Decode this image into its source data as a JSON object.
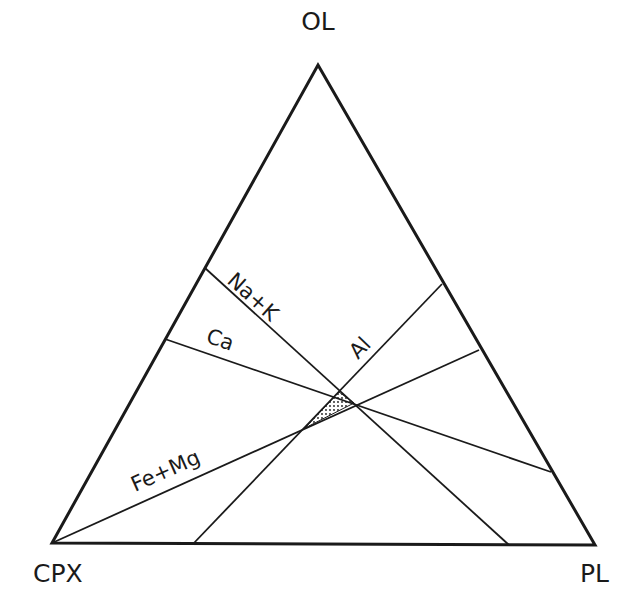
{
  "diagram": {
    "type": "ternary",
    "vertices": {
      "top": {
        "label": "OL",
        "x": 318,
        "y": 65
      },
      "left": {
        "label": "CPX",
        "x": 52,
        "y": 543
      },
      "right": {
        "label": "PL",
        "x": 595,
        "y": 545
      }
    },
    "lines": [
      {
        "label": "Na+K",
        "from": [
          205,
          268
        ],
        "to": [
          509,
          545
        ]
      },
      {
        "label": "Ca",
        "from": [
          165,
          339
        ],
        "to": [
          551,
          472
        ]
      },
      {
        "label": "Al",
        "from": [
          442,
          284
        ],
        "to": [
          193,
          544
        ]
      },
      {
        "label": "Fe+Mg",
        "from": [
          52,
          543
        ],
        "to": [
          479,
          350
        ]
      }
    ],
    "shaded_region": {
      "pattern": "stippled",
      "points": [
        [
          339,
          392
        ],
        [
          354,
          403
        ],
        [
          305,
          428
        ]
      ]
    },
    "colors": {
      "ink": "#1a1a1a",
      "background": "#ffffff"
    }
  }
}
